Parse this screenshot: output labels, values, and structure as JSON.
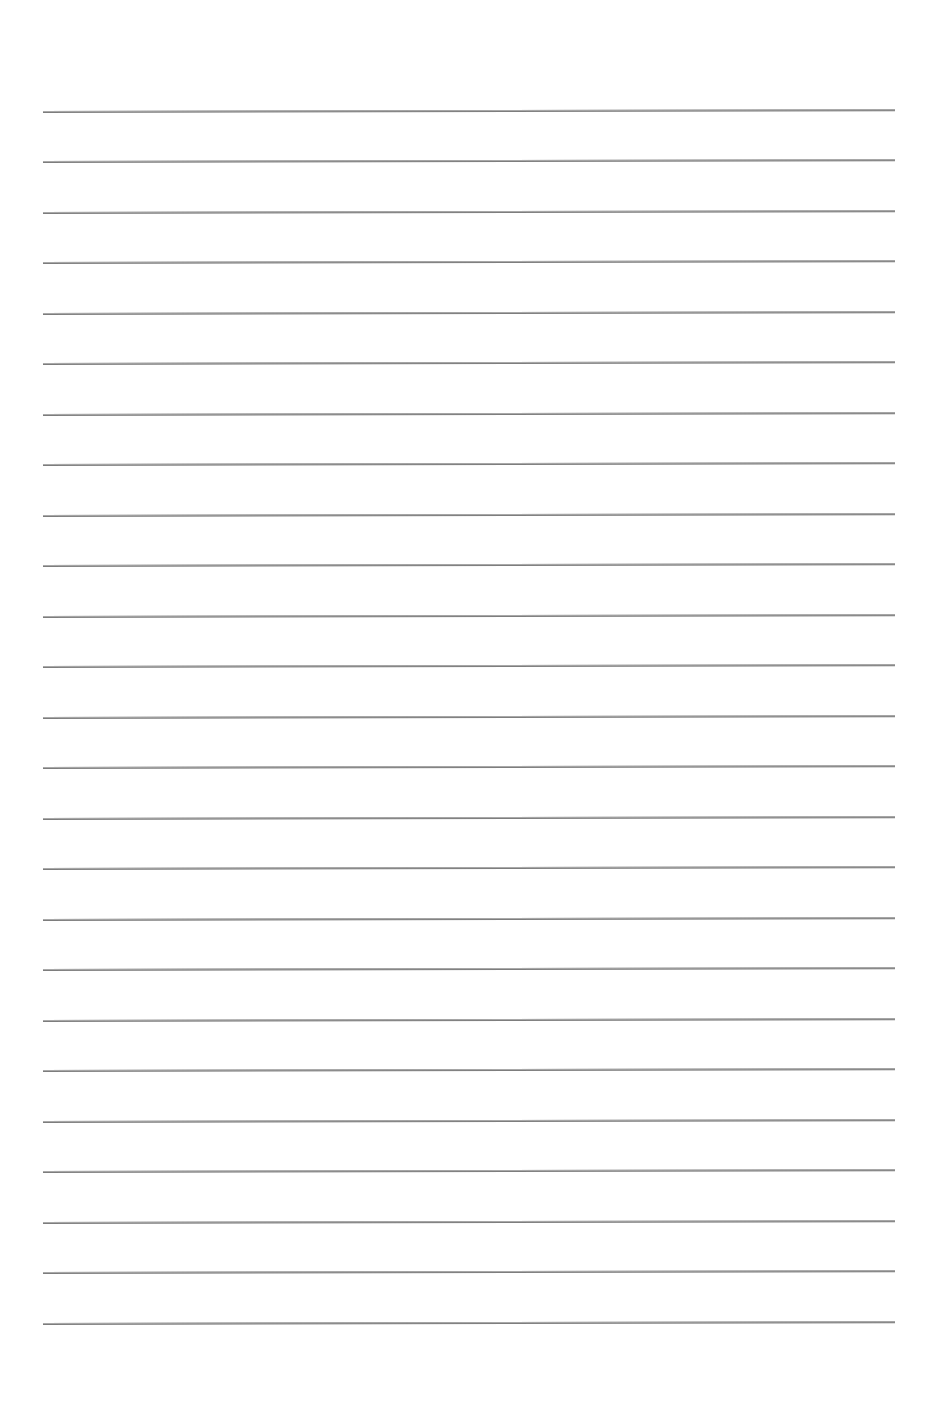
{
  "page": {
    "type": "lined-paper",
    "background_color": "#ffffff",
    "rule_color": "#7d7d7d",
    "rule_count": 25,
    "rule_left_px": 43,
    "rule_right_px": 895,
    "rule_positions_px": [
      111,
      161,
      212,
      262,
      313,
      363,
      414,
      464,
      515,
      565,
      616,
      666,
      717,
      767,
      818,
      868,
      919,
      969,
      1020,
      1070,
      1121,
      1171,
      1222,
      1272,
      1323
    ]
  }
}
